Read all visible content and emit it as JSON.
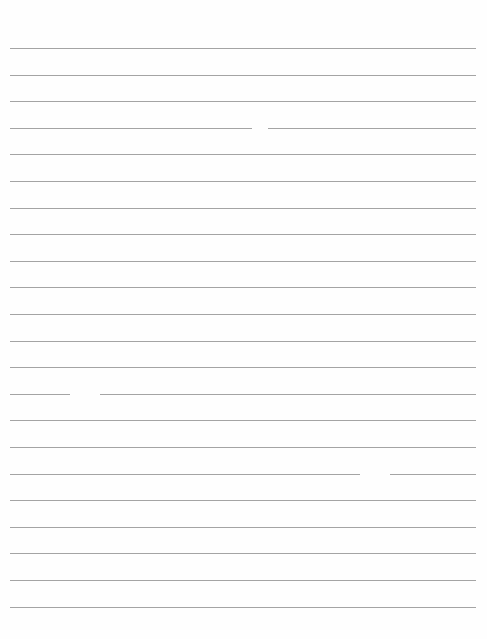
{
  "document": {
    "type": "lined-paper",
    "line_count": 22,
    "line_color": "#a4a4a4",
    "background": "#fefefe",
    "first_line_y": 48,
    "line_spacing": 26.6,
    "line_left": 10,
    "line_width": 466,
    "text": ""
  }
}
